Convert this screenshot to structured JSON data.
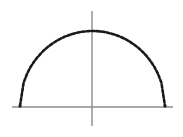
{
  "figure": {
    "name": "dotted-semicircle-plot",
    "width": 183,
    "height": 137,
    "background_color": "#ffffff",
    "has_title": false,
    "has_axis_labels": false,
    "has_tick_labels": false,
    "has_legend": false
  },
  "axes": {
    "x_axis": {
      "name": "horizontal-axis",
      "color": "#8c8c8c",
      "stroke_width": 1.4,
      "x_start": 12,
      "x_end": 173,
      "y": 107
    },
    "y_axis": {
      "name": "vertical-axis",
      "color": "#8c8c8c",
      "stroke_width": 1.4,
      "x": 92,
      "y_start": 11,
      "y_end": 126
    },
    "origin": {
      "x": 92,
      "y": 107
    }
  },
  "chart_data": {
    "type": "line",
    "title": "",
    "subtitle": "",
    "xlabel": "",
    "ylabel": "",
    "grid": false,
    "legend": [],
    "legend_position": "none",
    "xlim": [
      -1.26,
      1.4
    ],
    "ylim": [
      -0.26,
      1.32
    ],
    "series": [
      {
        "name": "semicircle",
        "style": "dotted",
        "color": "#1a1a1a",
        "stroke_width": 2.6,
        "dash_pattern": "3 2",
        "description": "upper half of a circle of radius 1 centered at the origin",
        "equation": "y = sqrt(1 - x^2)",
        "x": [
          -1.0,
          -0.95,
          -0.9,
          -0.85,
          -0.8,
          -0.75,
          -0.7,
          -0.65,
          -0.6,
          -0.55,
          -0.5,
          -0.45,
          -0.4,
          -0.35,
          -0.3,
          -0.25,
          -0.2,
          -0.15,
          -0.1,
          -0.05,
          0.0,
          0.05,
          0.1,
          0.15,
          0.2,
          0.25,
          0.3,
          0.35,
          0.4,
          0.45,
          0.5,
          0.55,
          0.6,
          0.65,
          0.7,
          0.75,
          0.8,
          0.85,
          0.9,
          0.95,
          1.0
        ],
        "y": [
          0.0,
          0.312,
          0.436,
          0.527,
          0.6,
          0.661,
          0.714,
          0.76,
          0.8,
          0.835,
          0.866,
          0.893,
          0.917,
          0.937,
          0.954,
          0.968,
          0.98,
          0.989,
          0.995,
          0.999,
          1.0,
          0.999,
          0.995,
          0.989,
          0.98,
          0.968,
          0.954,
          0.937,
          0.917,
          0.893,
          0.866,
          0.835,
          0.8,
          0.76,
          0.714,
          0.661,
          0.6,
          0.527,
          0.436,
          0.312,
          0.0
        ],
        "endpoints_px": {
          "left": {
            "x": 20,
            "y": 106
          },
          "right": {
            "x": 165,
            "y": 106
          }
        },
        "apex_px": {
          "x": 92,
          "y": 31
        },
        "radius_px": {
          "rx": 72.5,
          "ry": 75
        }
      }
    ]
  }
}
